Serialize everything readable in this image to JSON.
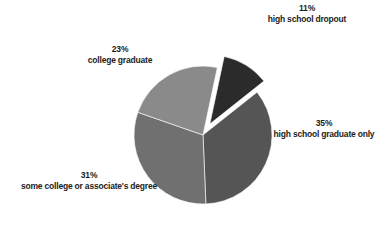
{
  "chart_data": {
    "type": "pie",
    "title": "",
    "subtitle": "",
    "xlabel": "",
    "ylabel": "",
    "grid": false,
    "legend": "none",
    "labels_position": "outside",
    "background_color": "#ffffff",
    "exploded_slice": "high school dropout",
    "units": "percent",
    "total": 100,
    "categories": [
      "high school dropout",
      "high school graduate only",
      "some college or associate's degree",
      "college graduate"
    ],
    "values": [
      11,
      35,
      31,
      23
    ],
    "value_labels": [
      "11%",
      "35%",
      "31%",
      "23%"
    ],
    "colors": [
      "#2b2b2b",
      "#555555",
      "#707070",
      "#8a8a8a"
    ],
    "slices": [
      {
        "label": "high school dropout",
        "value": 11,
        "value_label": "11%",
        "color": "#2b2b2b",
        "exploded": true
      },
      {
        "label": "high school graduate only",
        "value": 35,
        "value_label": "35%",
        "color": "#555555",
        "exploded": false
      },
      {
        "label": "some college or associate's degree",
        "value": 31,
        "value_label": "31%",
        "color": "#707070",
        "exploded": false
      },
      {
        "label": "college graduate",
        "value": 23,
        "value_label": "23%",
        "color": "#8a8a8a",
        "exploded": false
      }
    ],
    "geometry": {
      "center_x": 203,
      "center_y": 135,
      "radius": 69,
      "start_angle_deg": 12,
      "explode_offset": 13
    }
  },
  "labels": {
    "dropout": {
      "pct": "11%",
      "desc": "high school dropout"
    },
    "hsgrad": {
      "pct": "35%",
      "desc": "high school graduate only"
    },
    "somecollege": {
      "pct": "31%",
      "desc": "some college or associate's degree"
    },
    "collegegrad": {
      "pct": "23%",
      "desc": "college graduate"
    }
  }
}
